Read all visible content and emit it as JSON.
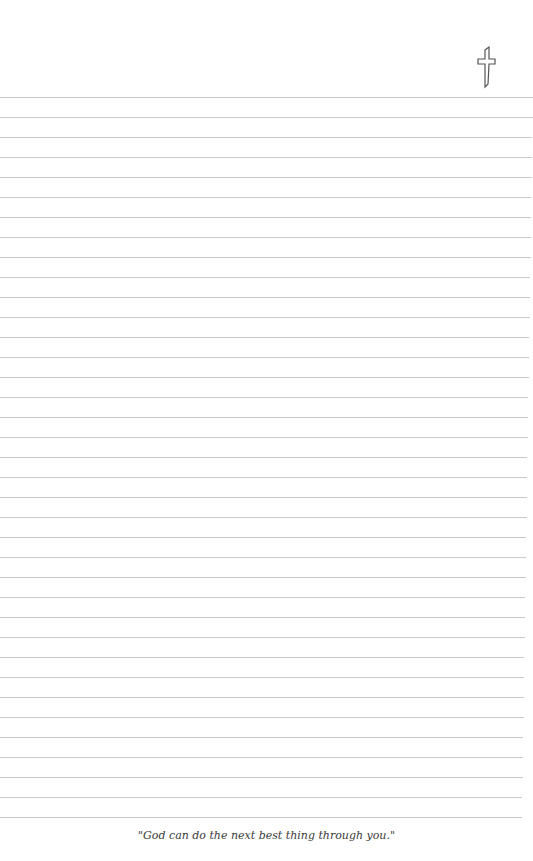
{
  "page": {
    "icon": "cross-icon",
    "line_count": 37,
    "line_spacing": 20,
    "line_color": "#c9c9c9",
    "footer_quote": "\"God can do the next best thing through you.\""
  }
}
